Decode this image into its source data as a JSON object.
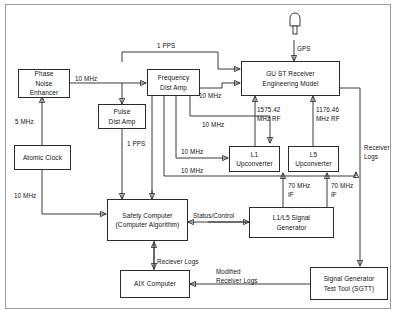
{
  "diagram": {
    "type": "block-diagram",
    "blocks": [
      {
        "id": "phase-noise-enhancer",
        "lines": [
          "Phase",
          "Noise",
          "Enhancer"
        ]
      },
      {
        "id": "atomic-clock",
        "lines": [
          "Atomic Clock"
        ]
      },
      {
        "id": "frequency-dist-amp",
        "lines": [
          "Frequency",
          "Dist Amp"
        ]
      },
      {
        "id": "pulse-dist-amp",
        "lines": [
          "Pulse",
          "Dist Amp"
        ]
      },
      {
        "id": "gust-receiver",
        "lines": [
          "GU ST Receiver",
          "Engineering Model"
        ]
      },
      {
        "id": "l1-upconverter",
        "lines": [
          "L1",
          "Upconverter"
        ]
      },
      {
        "id": "l5-upconverter",
        "lines": [
          "L5",
          "Upconverter"
        ]
      },
      {
        "id": "safety-computer",
        "lines": [
          "Safety Computer",
          "(Computer Algorithm)"
        ]
      },
      {
        "id": "l1l5-signal-generator",
        "lines": [
          "L1/L5 Signal",
          "Generator"
        ]
      },
      {
        "id": "aix-computer",
        "lines": [
          "AIX Computer"
        ]
      },
      {
        "id": "sgtt",
        "lines": [
          "Signal Generator",
          "Test Tool (SGTT)"
        ]
      }
    ],
    "signals": {
      "gps": "GPS",
      "pps_top": "1 PPS",
      "pps_pulse": "1 PPS",
      "mhz10_phase_to_freq": "10 MHz",
      "mhz5_clock_to_phase": "5 MHz",
      "mhz10_clock_to_safety": "10 MHz",
      "mhz10_freq_to_receiver": "10 MHz",
      "mhz10_freq_b": "10 MHz",
      "mhz10_freq_l1": "10 MHz",
      "mhz10_freq_l5": "10 MHz",
      "rf_l1": [
        "1575.42",
        "MHz RF"
      ],
      "rf_l5": [
        "1176.46",
        "MHz RF"
      ],
      "if_l1": [
        "70 MHz",
        "IF"
      ],
      "if_l5": [
        "70 MHz",
        "IF"
      ],
      "status_control": "Status/Control",
      "receiver_logs_right": [
        "Receiver",
        "Logs"
      ],
      "receiver_logs_center": "Reciever Logs",
      "modified_receiver_logs": [
        "Modified",
        "Receiver Logs"
      ]
    }
  },
  "colors": {
    "line": "#3a3a3a",
    "box_border": "#2b2b2b",
    "text": "#111111",
    "background": "#ffffff",
    "frame": "#9a9a9a"
  }
}
